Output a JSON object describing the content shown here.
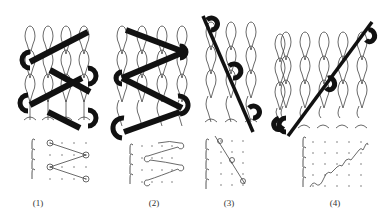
{
  "figure": {
    "panels": [
      {
        "id": "1",
        "label": "(1)",
        "description": "Inlay yarn lapping in V-shaped zig-zag across 4 wales, two repeats"
      },
      {
        "id": "2",
        "label": "(2)",
        "description": "Inlay yarn lapping across 4 wales with curl turns at each end"
      },
      {
        "id": "3",
        "label": "(3)",
        "description": "Diagonal inlay yarn descending across 3 wales, plus separate single-wale chain"
      },
      {
        "id": "4",
        "label": "(4)",
        "description": "Diagonal inlay yarn ascending across 5 wales"
      }
    ],
    "notation": {
      "grid_type": "lapping-dot-grid",
      "rows": 4
    }
  }
}
